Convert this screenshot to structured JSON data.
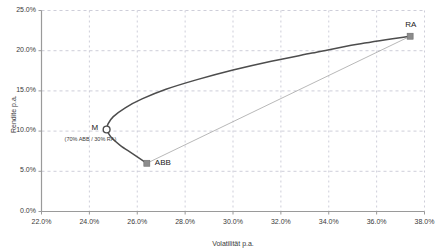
{
  "chart_data": {
    "type": "line",
    "title": "",
    "xlabel": "Volatilität p.a.",
    "ylabel": "Rendite p.a.",
    "xlim": [
      22.0,
      38.0
    ],
    "ylim": [
      0.0,
      25.0
    ],
    "xticks": [
      "22.0%",
      "24.0%",
      "26.0%",
      "28.0%",
      "30.0%",
      "32.0%",
      "34.0%",
      "36.0%",
      "38.0%"
    ],
    "xtick_values": [
      22.0,
      24.0,
      26.0,
      28.0,
      30.0,
      32.0,
      34.0,
      36.0,
      38.0
    ],
    "yticks": [
      "0.0%",
      "5.0%",
      "10.0%",
      "15.0%",
      "20.0%",
      "25.0%"
    ],
    "ytick_values": [
      0.0,
      5.0,
      10.0,
      15.0,
      20.0,
      25.0
    ],
    "grid": true,
    "legend": "none",
    "series": [
      {
        "name": "efficient-frontier",
        "type": "line",
        "color": "#4d4d4d",
        "points": [
          {
            "x": 26.4,
            "y": 6.0
          },
          {
            "x": 25.8,
            "y": 7.2
          },
          {
            "x": 25.3,
            "y": 8.2
          },
          {
            "x": 24.95,
            "y": 9.1
          },
          {
            "x": 24.78,
            "y": 9.8
          },
          {
            "x": 24.72,
            "y": 10.2
          },
          {
            "x": 24.78,
            "y": 10.9
          },
          {
            "x": 25.0,
            "y": 11.8
          },
          {
            "x": 25.5,
            "y": 12.9
          },
          {
            "x": 26.2,
            "y": 14.0
          },
          {
            "x": 27.2,
            "y": 15.2
          },
          {
            "x": 28.5,
            "y": 16.4
          },
          {
            "x": 30.0,
            "y": 17.6
          },
          {
            "x": 31.6,
            "y": 18.7
          },
          {
            "x": 33.3,
            "y": 19.7
          },
          {
            "x": 35.2,
            "y": 20.8
          },
          {
            "x": 37.4,
            "y": 21.8
          }
        ]
      },
      {
        "name": "combination-line",
        "type": "line",
        "color": "#a6a6a6",
        "points": [
          {
            "x": 26.4,
            "y": 6.0
          },
          {
            "x": 37.4,
            "y": 21.8
          }
        ]
      }
    ],
    "markers": [
      {
        "label": "M",
        "x": 24.72,
        "y": 10.2,
        "shape": "circle-open",
        "color": "#4d4d4d",
        "label_pos": "left",
        "annotation": "(70% ABB / 30% RA)"
      },
      {
        "label": "ABB",
        "x": 26.4,
        "y": 6.0,
        "shape": "square",
        "color": "#8c8c8c",
        "label_pos": "right",
        "annotation": ""
      },
      {
        "label": "RA",
        "x": 37.4,
        "y": 21.8,
        "shape": "square",
        "color": "#8c8c8c",
        "label_pos": "above",
        "annotation": ""
      }
    ]
  },
  "axes": {
    "x_title": "Volatilität p.a.",
    "y_title": "Rendite p.a."
  },
  "colors": {
    "frontier": "#4d4d4d",
    "combination": "#a6a6a6",
    "marker_fill": "#8c8c8c",
    "grid": "#b9b9c9",
    "axis": "#9a9a9a",
    "text": "#3a3a3a"
  },
  "labels": {
    "m": "M",
    "abb": "ABB",
    "ra": "RA",
    "m_annotation": "(70% ABB / 30% RA)"
  }
}
